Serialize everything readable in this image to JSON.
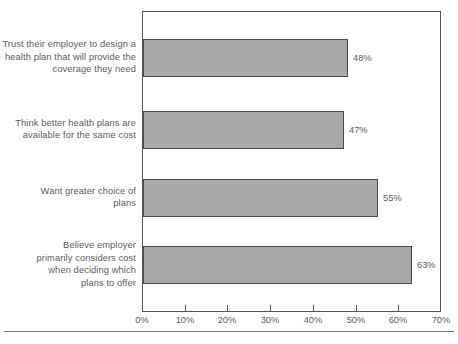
{
  "chart_data": {
    "type": "bar",
    "orientation": "horizontal",
    "title": "",
    "subtitle": "",
    "xlabel": "",
    "ylabel": "",
    "xlim": [
      0,
      70
    ],
    "grid": false,
    "legend": null,
    "categories": [
      "Trust their employer to design a health plan that will provide the coverage they need",
      "Think better health plans are available for the same cost",
      "Want greater choice of plans",
      "Believe employer primarily  considers cost when deciding which plans to offer"
    ],
    "values": [
      48,
      47,
      55,
      63
    ],
    "data_labels": [
      "48%",
      "47%",
      "55%",
      "63%"
    ],
    "xticks": [
      0,
      10,
      20,
      30,
      40,
      50,
      60,
      70
    ],
    "xtick_labels": [
      "0%",
      "10%",
      "20%",
      "30%",
      "40%",
      "50%",
      "60%",
      "70%"
    ],
    "bar_color": "#a9a9a9",
    "bar_border_color": "#4a4a4a",
    "text_color": "#5b5b5b",
    "axis_color": "#555555"
  },
  "labels": {
    "cat0_line1": "Trust their employer to design a",
    "cat0_line2": "health plan that will provide the",
    "cat0_line3": "coverage they need",
    "cat1_line1": "Think better health plans are",
    "cat1_line2": "available for the same cost",
    "cat2_line1": "Want greater choice of",
    "cat2_line2": "plans",
    "cat3_line1": "Believe employer",
    "cat3_line2": "primarily  considers cost",
    "cat3_line3": "when deciding which",
    "cat3_line4": "plans to offer"
  }
}
